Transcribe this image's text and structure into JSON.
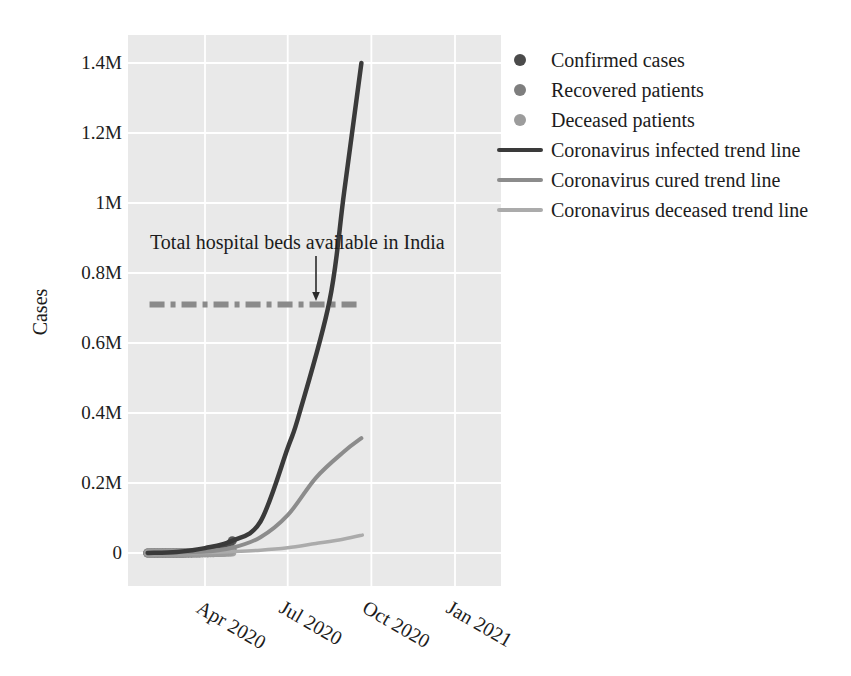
{
  "figure": {
    "ylabel": "Cases",
    "annotation": "Total hospital beds available in India",
    "legend": [
      {
        "label": "Confirmed cases",
        "marker": "dot",
        "color": "#4b4b4b"
      },
      {
        "label": "Recovered patients",
        "marker": "dot",
        "color": "#7e7e7e"
      },
      {
        "label": "Deceased patients",
        "marker": "dot",
        "color": "#9c9c9c"
      },
      {
        "label": "Coronavirus infected trend line",
        "marker": "line",
        "color": "#3a3a3a"
      },
      {
        "label": "Coronavirus cured trend line",
        "marker": "line",
        "color": "#8c8c8c"
      },
      {
        "label": "Coronavirus deceased trend line",
        "marker": "line",
        "color": "#ababab"
      }
    ],
    "colors": {
      "plot_bg": "#e9e9e9",
      "grid": "#ffffff",
      "text": "#1c1c1c",
      "beds_line": "#8a8a8a",
      "arrow": "#2a2a2a"
    }
  },
  "chart_data": {
    "type": "line",
    "title": "",
    "xlabel": "",
    "ylabel": "Cases",
    "grid": true,
    "legend_position": "outside upper right",
    "x_unit": "days since 2020-01-01",
    "ylim": [
      0,
      1450000
    ],
    "y_ticks": [
      {
        "label": "1.4M",
        "value": 1400000
      },
      {
        "label": "1.2M",
        "value": 1200000
      },
      {
        "label": "1M",
        "value": 1000000
      },
      {
        "label": "0.8M",
        "value": 800000
      },
      {
        "label": "0.6M",
        "value": 600000
      },
      {
        "label": "0.4M",
        "value": 400000
      },
      {
        "label": "0.2M",
        "value": 200000
      },
      {
        "label": "0",
        "value": 0
      }
    ],
    "x_ticks": [
      {
        "label": "Apr 2020",
        "day": 91
      },
      {
        "label": "Jul 2020",
        "day": 182
      },
      {
        "label": "Oct 2020",
        "day": 274
      },
      {
        "label": "Jan 2021",
        "day": 366
      }
    ],
    "reference_line": {
      "label": "Total hospital beds available in India",
      "value": 710000,
      "style": "dashdot",
      "span_days": [
        30,
        258
      ]
    },
    "series": [
      {
        "name": "Coronavirus infected trend line",
        "color": "#3a3a3a",
        "width": 4.5,
        "x": [
          28,
          60,
          91,
          121,
          152,
          182,
          195,
          228,
          244,
          263
        ],
        "values": [
          0,
          3000,
          14000,
          35000,
          90000,
          300000,
          400000,
          720000,
          1030000,
          1400000
        ]
      },
      {
        "name": "Coronavirus cured trend line",
        "color": "#8c8c8c",
        "width": 4,
        "x": [
          28,
          91,
          121,
          152,
          182,
          213,
          244,
          263
        ],
        "values": [
          0,
          4000,
          15000,
          45000,
          108000,
          215000,
          290000,
          328000
        ]
      },
      {
        "name": "Coronavirus deceased trend line",
        "color": "#ababab",
        "width": 3.5,
        "x": [
          28,
          91,
          121,
          152,
          182,
          213,
          244,
          264
        ],
        "values": [
          0,
          1500,
          4000,
          8000,
          15000,
          27000,
          40000,
          51000
        ]
      }
    ],
    "scatter": [
      {
        "name": "Confirmed cases",
        "color": "#4b4b4b",
        "radius": 4.5,
        "x": [
          28,
          31,
          34,
          37,
          40,
          43,
          46,
          49,
          52,
          55,
          58,
          61,
          64,
          67,
          70,
          73,
          76,
          79,
          82,
          85,
          88,
          91,
          94,
          97,
          100,
          103,
          106,
          109,
          112,
          115,
          118,
          121
        ],
        "values": [
          2,
          3,
          4,
          5,
          7,
          10,
          14,
          19,
          26,
          35,
          48,
          65,
          90,
          120,
          170,
          230,
          310,
          430,
          590,
          800,
          1100,
          1500,
          2060,
          2820,
          3870,
          5300,
          7260,
          9950,
          13600,
          18650,
          25550,
          35000
        ]
      },
      {
        "name": "Recovered patients",
        "color": "#7e7e7e",
        "radius": 4.5,
        "x": [
          28,
          31,
          34,
          37,
          40,
          43,
          46,
          49,
          52,
          55,
          58,
          61,
          64,
          67,
          70,
          73,
          76,
          79,
          82,
          85,
          88,
          91,
          94,
          97,
          100,
          103,
          106,
          109,
          112,
          115,
          118,
          121
        ],
        "values": [
          0,
          0,
          0,
          0,
          0,
          1,
          1,
          1,
          2,
          3,
          5,
          7,
          10,
          15,
          21,
          30,
          42,
          60,
          85,
          120,
          175,
          250,
          360,
          520,
          740,
          1050,
          1500,
          2150,
          3100,
          4400,
          6300,
          9000
        ]
      },
      {
        "name": "Deceased patients",
        "color": "#9c9c9c",
        "radius": 4,
        "x": [
          28,
          31,
          34,
          37,
          40,
          43,
          46,
          49,
          52,
          55,
          58,
          61,
          64,
          67,
          70,
          73,
          76,
          79,
          82,
          85,
          88,
          91,
          94,
          97,
          100,
          103,
          106,
          109,
          112,
          115,
          118,
          121
        ],
        "values": [
          0,
          0,
          0,
          0,
          0,
          0,
          0,
          0,
          0,
          0,
          1,
          1,
          1,
          2,
          3,
          5,
          7,
          9,
          13,
          19,
          26,
          37,
          52,
          74,
          105,
          145,
          205,
          290,
          410,
          580,
          815,
          1150
        ]
      }
    ]
  }
}
